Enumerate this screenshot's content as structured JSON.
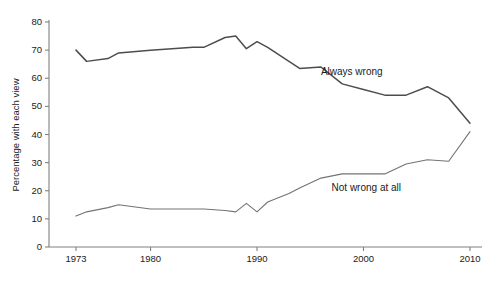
{
  "chart_data": {
    "type": "line",
    "title": "",
    "xlabel": "",
    "ylabel": "Percentage with each view",
    "xlim": [
      1972,
      2011
    ],
    "ylim": [
      0,
      80
    ],
    "grid": false,
    "legend_position": "inline-annotations",
    "x_ticks": [
      1973,
      1980,
      1990,
      2000,
      2010
    ],
    "x_tick_labels": [
      "1973",
      "1980",
      "1990",
      "2000",
      "2010"
    ],
    "y_ticks": [
      0,
      10,
      20,
      30,
      40,
      50,
      60,
      70,
      80
    ],
    "y_tick_labels": [
      "0",
      "10",
      "20",
      "30",
      "40",
      "50",
      "60",
      "70",
      "80"
    ],
    "series": [
      {
        "name": "Always wrong",
        "annotation": "Always wrong",
        "annotation_x": 1996,
        "annotation_y": 62,
        "color": "#4d4d4d",
        "x": [
          1973,
          1974,
          1976,
          1977,
          1980,
          1982,
          1984,
          1985,
          1987,
          1988,
          1989,
          1990,
          1991,
          1993,
          1994,
          1996,
          1998,
          2000,
          2002,
          2004,
          2006,
          2008,
          2010
        ],
        "values": [
          70,
          66,
          67,
          69,
          70,
          70.5,
          71,
          71,
          74.5,
          75,
          70.5,
          73,
          71,
          66,
          63.5,
          64,
          58,
          56,
          54,
          54,
          57,
          53,
          44
        ]
      },
      {
        "name": "Not wrong at all",
        "annotation": "Not wrong at all",
        "annotation_x": 1997,
        "annotation_y": 21,
        "color": "#737373",
        "x": [
          1973,
          1974,
          1976,
          1977,
          1980,
          1982,
          1984,
          1985,
          1987,
          1988,
          1989,
          1990,
          1991,
          1993,
          1994,
          1996,
          1998,
          2000,
          2002,
          2004,
          2006,
          2008,
          2010
        ],
        "values": [
          11,
          12.5,
          14,
          15,
          13.5,
          13.5,
          13.5,
          13.5,
          13,
          12.5,
          15.5,
          12.5,
          16,
          19,
          21,
          24.5,
          26,
          26,
          26,
          29.5,
          31,
          30.5,
          41
        ]
      }
    ]
  }
}
